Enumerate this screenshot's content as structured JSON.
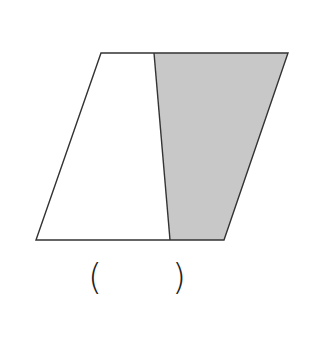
{
  "diagram": {
    "type": "parallelogram-partition",
    "vertices": {
      "top_left": [
        101,
        53
      ],
      "top_right": [
        288,
        53
      ],
      "bottom_right": [
        224,
        240
      ],
      "bottom_left": [
        36,
        240
      ],
      "divider_top": [
        154,
        53
      ],
      "divider_bottom": [
        170,
        240
      ]
    },
    "colors": {
      "stroke": "#333333",
      "shaded_fill": "#c8c8c8",
      "unshaded_fill": "#ffffff"
    }
  },
  "answer_blank": {
    "open_paren": "(",
    "close_paren": ")",
    "value": ""
  }
}
